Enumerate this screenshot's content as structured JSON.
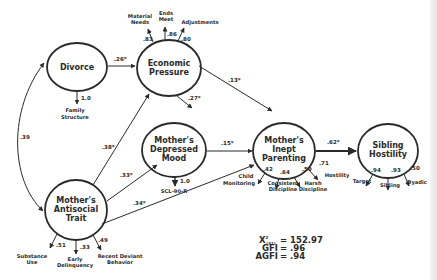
{
  "diagram": {
    "type": "structural_equation_model",
    "latent_constructs": [
      {
        "id": "divorce",
        "label_lines": [
          "Divorce"
        ]
      },
      {
        "id": "economic_pressure",
        "label_lines": [
          "Economic",
          "Pressure"
        ]
      },
      {
        "id": "depressed_mood",
        "label_lines": [
          "Mother's",
          "Depressed",
          "Mood"
        ]
      },
      {
        "id": "inept_parenting",
        "label_lines": [
          "Mother's",
          "Inept",
          "Parenting"
        ]
      },
      {
        "id": "sibling_hostility",
        "label_lines": [
          "Sibling",
          "Hostility"
        ]
      },
      {
        "id": "antisocial_trait",
        "label_lines": [
          "Mother's",
          "Antisocial",
          "Trait"
        ]
      }
    ],
    "indicators": {
      "divorce": [
        {
          "label_lines": [
            "Family",
            "Structure"
          ],
          "loading": "1.0"
        }
      ],
      "economic_pressure": [
        {
          "label_lines": [
            "Material",
            "Needs"
          ],
          "loading": ".83"
        },
        {
          "label_lines": [
            "Ends",
            "Meet"
          ],
          "loading": ".86"
        },
        {
          "label_lines": [
            "Adjustments"
          ],
          "loading": ".80"
        }
      ],
      "depressed_mood": [
        {
          "label_lines": [
            "SCL-90-R"
          ],
          "loading": "1.0"
        }
      ],
      "inept_parenting": [
        {
          "label_lines": [
            "Child",
            "Monitoring"
          ],
          "loading": ".42"
        },
        {
          "label_lines": [
            "Consistent",
            "Discipline"
          ],
          "loading": ".64"
        },
        {
          "label_lines": [
            "Harsh",
            "Discipline"
          ],
          "loading": ".59"
        },
        {
          "label_lines": [
            "Hostility"
          ],
          "loading": ".71"
        }
      ],
      "sibling_hostility": [
        {
          "label_lines": [
            "Target"
          ],
          "loading": ".94"
        },
        {
          "label_lines": [
            "Sibling"
          ],
          "loading": ".93"
        },
        {
          "label_lines": [
            "Dyadic"
          ],
          "loading": ".50"
        }
      ],
      "antisocial_trait": [
        {
          "label_lines": [
            "Substance",
            "Use"
          ],
          "loading": ".51"
        },
        {
          "label_lines": [
            "Early",
            "Delinquency"
          ],
          "loading": ".33"
        },
        {
          "label_lines": [
            "Recent Deviant",
            "Behavior"
          ],
          "loading": ".49"
        }
      ]
    },
    "paths": [
      {
        "from": "divorce",
        "to": "economic_pressure",
        "coef": ".26*"
      },
      {
        "from": "economic_pressure",
        "to": "depressed_mood",
        "coef": ".27*"
      },
      {
        "from": "economic_pressure",
        "to": "inept_parenting",
        "coef": ".13*"
      },
      {
        "from": "depressed_mood",
        "to": "inept_parenting",
        "coef": ".15*"
      },
      {
        "from": "inept_parenting",
        "to": "sibling_hostility",
        "coef": ".62*"
      },
      {
        "from": "antisocial_trait",
        "to": "economic_pressure",
        "coef": ".38*"
      },
      {
        "from": "antisocial_trait",
        "to": "depressed_mood",
        "coef": ".33*"
      },
      {
        "from": "antisocial_trait",
        "to": "inept_parenting",
        "coef": ".34*"
      },
      {
        "from": "antisocial_trait",
        "to": "divorce",
        "coef": ".39",
        "type": "correlation"
      }
    ],
    "fit_stats": {
      "chi_square_symbol": "X",
      "chi_square_sup": "2",
      "chi_square_sub": "(41)",
      "chi_square_value": "= 152.97",
      "gfi_label": "GFI",
      "gfi_value": "= .96",
      "agfi_label": "AGFI",
      "agfi_value": "= .94"
    },
    "colors": {
      "stroke": "#2a2a2a",
      "background": "#ffffff"
    }
  }
}
